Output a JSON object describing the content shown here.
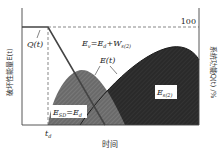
{
  "diagram": {
    "y_left_label": "破坏性能量E(t)",
    "y_right_label": "系统功能Q(t) /%",
    "x_label": "时间",
    "x_tick_td": "t",
    "x_tick_td_sub": "d",
    "y_right_tick": "100",
    "label_qt": "Q(t)",
    "label_et": "E(t)",
    "label_ev_main": "E",
    "label_ev_sub": "v",
    "label_ev_rest1": "=E",
    "label_ev_rest1_sub": "d",
    "label_ev_rest2": "+W",
    "label_ev_rest2_sub": "s(2)",
    "label_esd_main": "E",
    "label_esd_sub": "SD",
    "label_esd_rest": "=E",
    "label_esd_rest_sub": "d",
    "label_es2_main": "E",
    "label_es2_sub": "s(2)",
    "colors": {
      "esd_fill": "#6e6e6e",
      "es2_fill": "#2e2e2e",
      "line": "#333333"
    }
  }
}
